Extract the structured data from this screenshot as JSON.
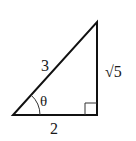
{
  "diagram": {
    "type": "right-triangle",
    "stroke_color": "#111111",
    "vertices": {
      "bottom_left": [
        13,
        115
      ],
      "bottom_right": [
        97,
        115
      ],
      "top": [
        97,
        22
      ]
    },
    "labels": {
      "hypotenuse": "3",
      "vertical_leg": "√5",
      "horizontal_leg": "2",
      "angle": "θ"
    },
    "right_angle_marker": true
  }
}
